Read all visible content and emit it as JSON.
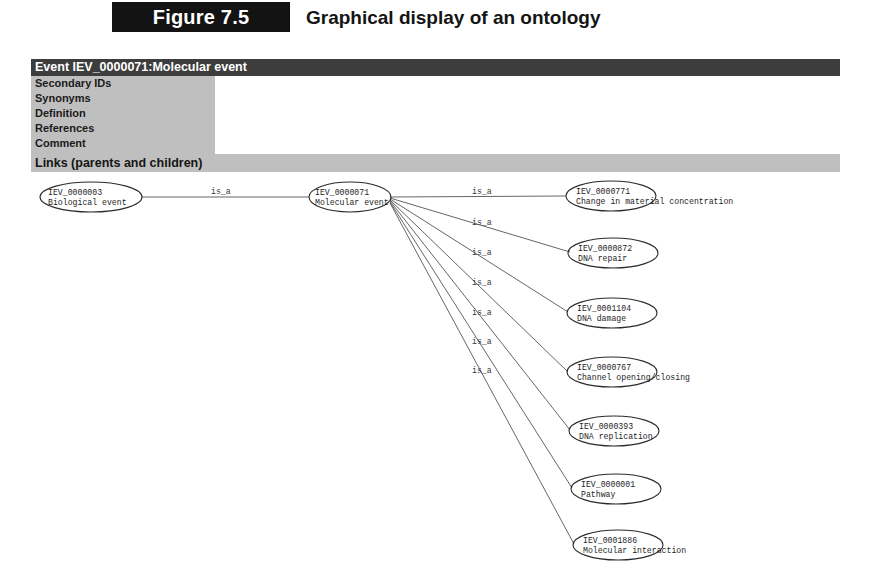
{
  "figure": {
    "number": "Figure 7.5",
    "title": "Graphical display of an ontology"
  },
  "window": {
    "title": "Event IEV_0000071:Molecular event",
    "fields": [
      {
        "label": "Secondary IDs",
        "value": ""
      },
      {
        "label": "Synonyms",
        "value": ""
      },
      {
        "label": "Definition",
        "value": ""
      },
      {
        "label": "References",
        "value": ""
      },
      {
        "label": "Comment",
        "value": ""
      }
    ],
    "links_section_label": "Links (parents and children)"
  },
  "graph": {
    "edge_relation_label": "is_a",
    "parent_node": {
      "id": "IEV_0000003",
      "name": "Biological event"
    },
    "focus_node": {
      "id": "IEV_0000071",
      "name": "Molecular event"
    },
    "child_nodes": [
      {
        "id": "IEV_0000771",
        "name": "Change in material concentration"
      },
      {
        "id": "IEV_0000872",
        "name": "DNA repair"
      },
      {
        "id": "IEV_0001104",
        "name": "DNA damage"
      },
      {
        "id": "IEV_0000767",
        "name": "Channel opening/closing"
      },
      {
        "id": "IEV_0000393",
        "name": "DNA replication"
      },
      {
        "id": "IEV_0000001",
        "name": "Pathway"
      },
      {
        "id": "IEV_0001886",
        "name": "Molecular interaction"
      }
    ],
    "edge_labels": [
      "is_a",
      "is_a",
      "is_a",
      "is_a",
      "is_a",
      "is_a",
      "is_a",
      "is_a"
    ]
  },
  "colors": {
    "titlebar_bg": "#3d3d3d",
    "field_label_bg": "#bfbfbf",
    "figure_box_bg": "#131313",
    "node_stroke": "#2a2a2a",
    "edge_stroke": "#555555",
    "page_bg": "#ffffff"
  }
}
